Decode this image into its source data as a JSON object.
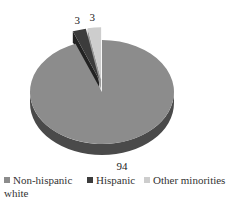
{
  "chart_data": {
    "type": "pie",
    "style": "3d-exploded",
    "title": "",
    "categories": [
      "Non-hispanic white",
      "Hispanic",
      "Other minorities"
    ],
    "values": [
      94,
      3,
      3
    ],
    "data_labels": [
      "94",
      "3",
      "3"
    ],
    "colors": [
      "#8c8c8c",
      "#3c3c3c",
      "#cdcdcd"
    ],
    "side_colors": [
      "#4a4a4a",
      "#222222",
      "#9a9a9a"
    ],
    "exploded": [
      false,
      true,
      true
    ],
    "legend": {
      "placement": "bottom",
      "entries": [
        {
          "label_line1": "Non-hispanic",
          "label_line2": "white"
        },
        {
          "label_line1": "Hispanic"
        },
        {
          "label_line1": "Other minorities"
        }
      ]
    }
  }
}
